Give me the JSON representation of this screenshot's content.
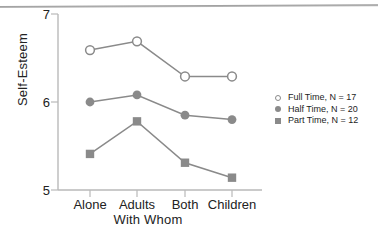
{
  "chart_data": {
    "type": "line",
    "title": "",
    "xlabel": "With Whom",
    "ylabel": "Self-Esteem",
    "categories": [
      "Alone",
      "Adults",
      "Both",
      "Children"
    ],
    "ylim": [
      5,
      7
    ],
    "yticks": [
      5,
      6,
      7
    ],
    "ytick_labels": [
      "5",
      "6",
      "7"
    ],
    "grid": false,
    "legend_position": "right",
    "series": [
      {
        "name": "Full Time, N = 17",
        "label": "Full Time",
        "n": 17,
        "marker": "open-circle",
        "values": [
          6.59,
          6.69,
          6.29,
          6.29
        ]
      },
      {
        "name": "Half Time, N = 20",
        "label": "Half Time",
        "n": 20,
        "marker": "filled-circle",
        "values": [
          6.0,
          6.08,
          5.85,
          5.8
        ]
      },
      {
        "name": "Part Time, N = 12",
        "label": "Part Time",
        "n": 12,
        "marker": "filled-square",
        "values": [
          5.41,
          5.78,
          5.31,
          5.14
        ]
      }
    ]
  },
  "axis": {
    "y_label": "Self-Esteem",
    "x_label": "With Whom",
    "y_ticks": [
      "7",
      "6",
      "5"
    ],
    "x_ticks": [
      "Alone",
      "Adults",
      "Both",
      "Children"
    ]
  },
  "legend": {
    "entries": [
      {
        "text": "Full Time, N = 17"
      },
      {
        "text": "Half Time, N = 20"
      },
      {
        "text": "Part Time, N = 12"
      }
    ]
  },
  "colors": {
    "line": "#8a8a8a",
    "marker": "#8a8a8a",
    "axis": "#b9b9b9",
    "text": "#222222",
    "background": "#ffffff"
  }
}
